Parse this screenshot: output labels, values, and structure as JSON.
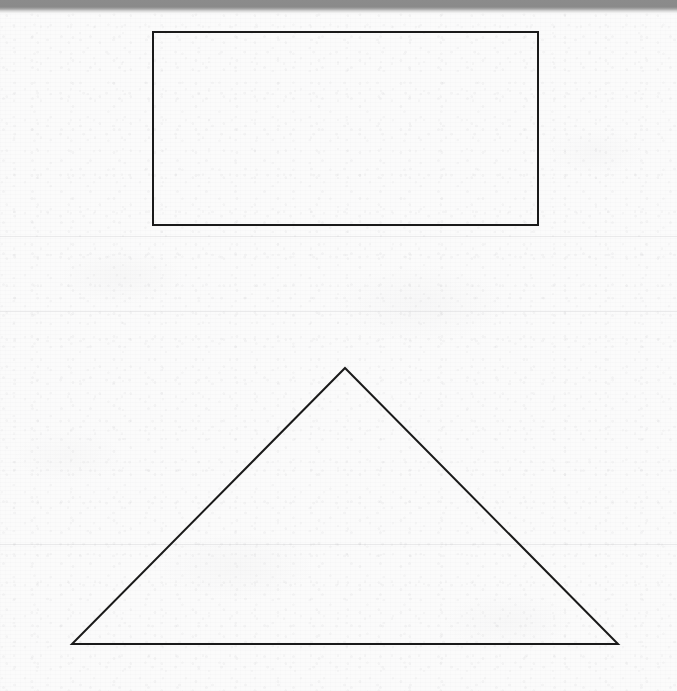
{
  "document": {
    "kind": "scanned-worksheet",
    "title": "Geometric shapes worksheet scan",
    "page_width": 677,
    "page_height": 691,
    "background_color": "#fbfbfb",
    "ink_color": "#1a1a1a",
    "scanner_band_color": "#8a8a8a"
  },
  "top_edge_band": {
    "label": "scanner edge band",
    "color": "#8a8a8a",
    "height_px": 9
  },
  "shapes": [
    {
      "id": "rectangle",
      "name": "rectangle",
      "label": "Rectangle",
      "stroke": "#1a1a1a",
      "stroke_width": 2,
      "fill": "none",
      "x": 153,
      "y": 32,
      "width": 385,
      "height": 193,
      "points": "153,32 538,32 538,225 153,225"
    },
    {
      "id": "triangle",
      "name": "triangle",
      "label": "Triangle",
      "stroke": "#1a1a1a",
      "stroke_width": 2,
      "fill": "none",
      "apex_x": 345,
      "apex_y": 368,
      "base_left_x": 72,
      "base_left_y": 644,
      "base_right_x": 618,
      "base_right_y": 644,
      "base_width": 546,
      "height": 276,
      "points": "345,368 618,644 72,644"
    }
  ],
  "scan_artifacts": {
    "seam_lines_y": [
      236,
      311,
      544
    ],
    "seam_color": "#969aa0"
  }
}
